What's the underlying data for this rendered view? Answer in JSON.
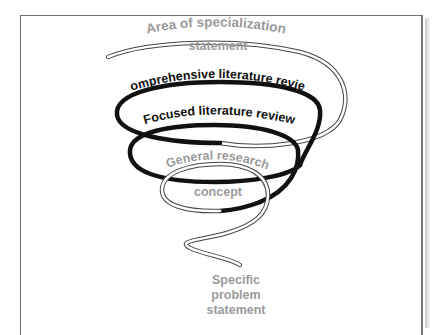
{
  "diagram": {
    "type": "spiral-funnel",
    "labels": {
      "area_line1": "Area of specialization",
      "area_line2": "statement",
      "comprehensive": "Comprehensive literature review",
      "focused": "Focused literature review",
      "general_line1": "General research",
      "general_line2": "concept",
      "specific_line1": "Specific",
      "specific_line2": "problem",
      "specific_line3": "statement"
    },
    "colors": {
      "dark_stroke": "#111111",
      "outline_stroke": "#555555",
      "grey_text": "#9a9a9a",
      "frame": "#6e6e6e"
    }
  }
}
